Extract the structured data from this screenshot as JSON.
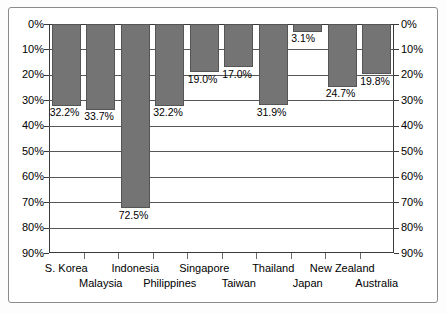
{
  "chart_data": {
    "type": "bar",
    "title": "",
    "subtitle": "",
    "xlabel": "",
    "ylabel": "",
    "orientation": "downward",
    "grid": true,
    "legend": null,
    "ylim": [
      0,
      90
    ],
    "y_tick_values": [
      0,
      10,
      20,
      30,
      40,
      50,
      60,
      70,
      80,
      90
    ],
    "y_tick_labels_left": [
      "0%",
      "10%",
      "20%",
      "30%",
      "40%",
      "50%",
      "60%",
      "70%",
      "80%",
      "90%"
    ],
    "y_tick_labels_right": [
      "0%",
      "10%",
      "20%",
      "30%",
      "40%",
      "50%",
      "60%",
      "70%",
      "80%",
      "90%"
    ],
    "y_axis_position": "both",
    "categories": [
      "S. Korea",
      "Malaysia",
      "Indonesia",
      "Philippines",
      "Singapore",
      "Taiwan",
      "Thailand",
      "Japan",
      "New Zealand",
      "Australia"
    ],
    "values": [
      32.2,
      33.7,
      72.5,
      32.2,
      19.0,
      17.0,
      31.9,
      3.1,
      24.7,
      19.8
    ],
    "data_labels": [
      "32.2%",
      "33.7%",
      "72.5%",
      "32.2%",
      "19.0%",
      "17.0%",
      "31.9%",
      "3.1%",
      "24.7%",
      "19.8%"
    ],
    "bar_color": "#747474",
    "grid_color": "#575757",
    "axis_color": "#3a3a3a",
    "label_rows": [
      0,
      1,
      0,
      1,
      0,
      1,
      0,
      1,
      0,
      1
    ]
  }
}
